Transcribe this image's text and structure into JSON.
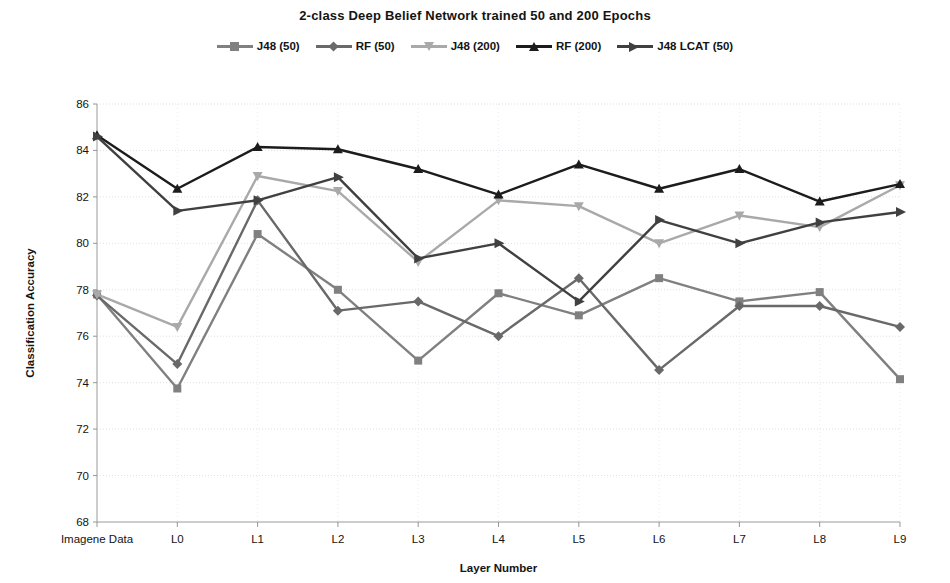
{
  "chart_data": {
    "type": "line",
    "title": "2-class Deep Belief Network trained 50 and 200 Epochs",
    "xlabel": "Layer Number",
    "ylabel": "Classification Accuracy",
    "categories": [
      "Imagene Data",
      "L0",
      "L1",
      "L2",
      "L3",
      "L4",
      "L5",
      "L6",
      "L7",
      "L8",
      "L9"
    ],
    "ylim": [
      68,
      86
    ],
    "ytick_step": 2,
    "yticks": [
      68,
      70,
      72,
      74,
      76,
      78,
      80,
      82,
      84,
      86
    ],
    "grid": true,
    "legend_position": "top",
    "series": [
      {
        "name": "J48 (50)",
        "color": "#808080",
        "marker": "square",
        "values": [
          77.8,
          73.75,
          80.4,
          78.0,
          74.95,
          77.85,
          76.9,
          78.5,
          77.5,
          77.9,
          74.15
        ]
      },
      {
        "name": "RF (50)",
        "color": "#696969",
        "marker": "diamond",
        "values": [
          77.75,
          74.8,
          81.85,
          77.1,
          77.5,
          76.0,
          78.5,
          74.55,
          77.3,
          77.3,
          76.4
        ]
      },
      {
        "name": "J48 (200)",
        "color": "#a9a9a9",
        "marker": "tri-down",
        "values": [
          77.8,
          76.4,
          82.9,
          82.25,
          79.2,
          81.85,
          81.6,
          80.0,
          81.2,
          80.7,
          82.5
        ]
      },
      {
        "name": "RF (200)",
        "color": "#1c1c1c",
        "marker": "triangle",
        "values": [
          84.65,
          82.35,
          84.15,
          84.05,
          83.2,
          82.1,
          83.4,
          82.35,
          83.2,
          81.8,
          82.55
        ]
      },
      {
        "name": "J48 LCAT (50)",
        "color": "#404040",
        "marker": "arrow",
        "values": [
          84.6,
          81.4,
          81.85,
          82.85,
          79.35,
          80.0,
          77.5,
          81.0,
          80.0,
          80.9,
          81.35
        ]
      }
    ]
  }
}
